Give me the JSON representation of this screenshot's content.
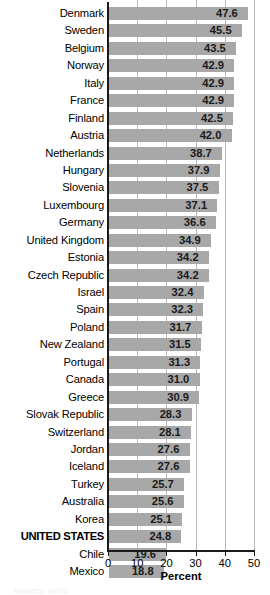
{
  "chart_data": {
    "type": "bar",
    "orientation": "horizontal",
    "title": "",
    "xlabel": "Percent",
    "ylabel": "",
    "xlim": [
      0,
      50
    ],
    "xticks": [
      0,
      10,
      20,
      30,
      40,
      50
    ],
    "xtick_labels": [
      "0",
      "10",
      "20",
      "30",
      "40",
      "50"
    ],
    "grid": true,
    "grid_axis": "x",
    "legend": null,
    "bar_color": "#a8a8a8",
    "value_label_format": "one-decimal",
    "highlighted_category": "UNITED STATES",
    "categories": [
      "Denmark",
      "Sweden",
      "Belgium",
      "Norway",
      "Italy",
      "France",
      "Finland",
      "Austria",
      "Netherlands",
      "Hungary",
      "Slovenia",
      "Luxembourg",
      "Germany",
      "United Kingdom",
      "Estonia",
      "Czech Republic",
      "Israel",
      "Spain",
      "Poland",
      "New Zealand",
      "Portugal",
      "Canada",
      "Greece",
      "Slovak Republic",
      "Switzerland",
      "Jordan",
      "Iceland",
      "Turkey",
      "Australia",
      "Korea",
      "UNITED STATES",
      "Chile",
      "Mexico"
    ],
    "values": [
      47.6,
      45.5,
      43.5,
      42.9,
      42.9,
      42.9,
      42.5,
      42.0,
      38.7,
      37.9,
      37.5,
      37.1,
      36.6,
      34.9,
      34.2,
      34.2,
      32.4,
      32.3,
      31.7,
      31.5,
      31.3,
      31.0,
      30.9,
      28.3,
      28.1,
      27.6,
      27.6,
      25.7,
      25.6,
      25.1,
      24.8,
      19.6,
      18.8
    ],
    "value_labels": [
      "47.6",
      "45.5",
      "43.5",
      "42.9",
      "42.9",
      "42.9",
      "42.5",
      "42.0",
      "38.7",
      "37.9",
      "37.5",
      "37.1",
      "36.6",
      "34.9",
      "34.2",
      "34.2",
      "32.4",
      "32.3",
      "31.7",
      "31.5",
      "31.3",
      "31.0",
      "30.9",
      "28.3",
      "28.1",
      "27.6",
      "27.6",
      "25.7",
      "25.6",
      "25.1",
      "24.8",
      "19.6",
      "18.8"
    ]
  },
  "axis": {
    "title": "Percent"
  },
  "footer": {
    "source_note": "SOURCE: OECD"
  }
}
